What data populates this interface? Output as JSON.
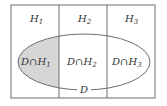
{
  "diagram": {
    "type": "venn-partition",
    "partitions": [
      {
        "symbol": "H",
        "sub": "1"
      },
      {
        "symbol": "H",
        "sub": "2"
      },
      {
        "symbol": "H",
        "sub": "3"
      }
    ],
    "intersections": [
      {
        "prefix": "D∩H",
        "sub": "1",
        "shaded": true
      },
      {
        "prefix": "D∩H",
        "sub": "2",
        "shaded": false
      },
      {
        "prefix": "D∩H",
        "sub": "3",
        "shaded": false
      }
    ],
    "event_label": "D",
    "colors": {
      "line": "#6e6e6e",
      "shade": "#d6d6d6",
      "text": "#333333",
      "background": "#ffffff"
    }
  }
}
